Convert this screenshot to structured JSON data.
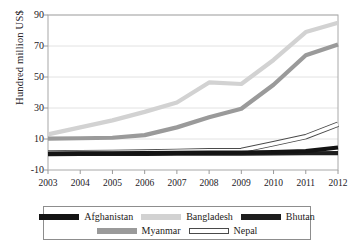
{
  "chart_data": {
    "type": "line",
    "title": "",
    "xlabel": "",
    "ylabel": "Hundred million US$",
    "x": [
      2003,
      2004,
      2005,
      2006,
      2007,
      2008,
      2009,
      2010,
      2011,
      2012
    ],
    "xtick_labels": [
      "2003",
      "2004",
      "2005",
      "2006",
      "2007",
      "2008",
      "2009",
      "2010",
      "2011",
      "2012"
    ],
    "ytick_labels": [
      "90",
      "70",
      "50",
      "30",
      "10",
      "-10"
    ],
    "ytick_values": [
      90,
      70,
      50,
      30,
      10,
      -10
    ],
    "ylim": [
      -10,
      90
    ],
    "xlim": [
      2003,
      2012
    ],
    "grid": true,
    "legend_position": "bottom",
    "series": [
      {
        "name": "Afghanistan",
        "color": "#141414",
        "values": [
          0.6,
          0.7,
          0.8,
          0.9,
          1.0,
          1.2,
          1.3,
          1.6,
          2.2,
          4.5
        ]
      },
      {
        "name": "Bangladesh",
        "color": "#d2d2d2",
        "values": [
          13.0,
          17.5,
          22.0,
          27.5,
          33.5,
          46.5,
          45.5,
          61.0,
          79.0,
          85.0
        ]
      },
      {
        "name": "Bhutan",
        "color": "#1e1e1e",
        "values": [
          0.3,
          0.35,
          0.4,
          0.45,
          0.5,
          0.55,
          0.6,
          0.7,
          0.8,
          0.9
        ]
      },
      {
        "name": "Myanmar",
        "color": "#9a9a9a",
        "values": [
          10.3,
          10.5,
          10.8,
          12.5,
          17.5,
          24.0,
          29.5,
          45.0,
          64.0,
          71.0
        ]
      },
      {
        "name": "Nepal",
        "color": "#ffffff",
        "outline": "#4a4a4a",
        "values": [
          1.0,
          1.2,
          1.4,
          1.6,
          2.0,
          2.4,
          2.6,
          7.0,
          11.5,
          19.5
        ]
      }
    ]
  },
  "legend": {
    "rows": [
      [
        {
          "label": "Afghanistan",
          "swatch": "afghanistan-swatch"
        },
        {
          "label": "Bangladesh",
          "swatch": "bangladesh-swatch"
        },
        {
          "label": "Bhutan",
          "swatch": "bhutan-swatch"
        }
      ],
      [
        {
          "label": "Myanmar",
          "swatch": "myanmar-swatch"
        },
        {
          "label": "Nepal",
          "swatch": "nepal-swatch"
        }
      ]
    ]
  }
}
